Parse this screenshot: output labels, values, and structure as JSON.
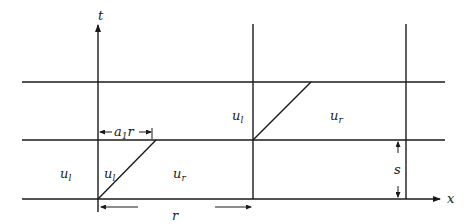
{
  "diagram": {
    "axes": {
      "t_label": "t",
      "x_label": "x"
    },
    "regions": {
      "left_outer": {
        "base": "u",
        "sub": "l"
      },
      "left_wedge_l": {
        "base": "u",
        "sub": "l"
      },
      "left_wedge_r": {
        "base": "u",
        "sub": "r"
      },
      "mid_l": {
        "base": "u",
        "sub": "l"
      },
      "mid_r": {
        "base": "u",
        "sub": "r"
      }
    },
    "dimensions": {
      "a1r": {
        "base": "a",
        "sub": "1",
        "tail": "r"
      },
      "r": "r",
      "s": "s"
    },
    "colors": {
      "stroke": "#1a1a1a",
      "background": "#ffffff"
    }
  }
}
